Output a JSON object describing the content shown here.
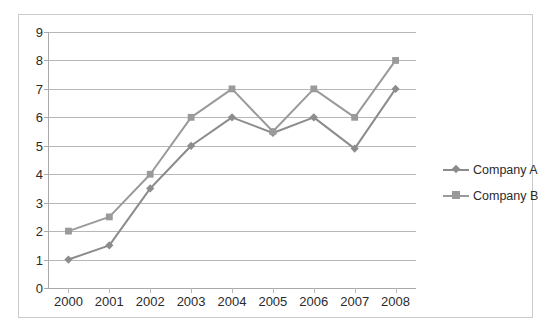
{
  "chart_data": {
    "type": "line",
    "title": "",
    "subtitle": "",
    "xlabel": "",
    "ylabel": "",
    "categories": [
      "2000",
      "2001",
      "2002",
      "2003",
      "2004",
      "2005",
      "2006",
      "2007",
      "2008"
    ],
    "series": [
      {
        "name": "Company A",
        "marker": "diamond",
        "color": "#8c8c8c",
        "values": [
          1,
          1.5,
          3.5,
          5,
          6,
          5.45,
          6,
          4.9,
          7
        ]
      },
      {
        "name": "Company B",
        "marker": "square",
        "color": "#9a9a9a",
        "values": [
          2,
          2.5,
          4,
          6,
          7,
          5.5,
          7,
          6,
          8
        ]
      }
    ],
    "ylim": [
      0,
      9
    ],
    "ytick_step": 1,
    "yticks": [
      "9",
      "8",
      "7",
      "6",
      "5",
      "4",
      "3",
      "2",
      "1",
      "0"
    ],
    "grid": true,
    "grid_axis": "y",
    "legend_position": "right",
    "legend": [
      "Company A",
      "Company B"
    ]
  },
  "legend": {
    "items": [
      {
        "label": "Company A",
        "marker_icon": "diamond-marker-icon",
        "color": "#8c8c8c"
      },
      {
        "label": "Company B",
        "marker_icon": "square-marker-icon",
        "color": "#9a9a9a"
      }
    ]
  },
  "colors": {
    "series_a": "#8c8c8c",
    "series_b": "#9a9a9a",
    "gridline": "#b6b7b8",
    "axis": "#a9aaab",
    "frame_border": "#c9cacb",
    "text": "#2b2b2b",
    "background": "#ffffff"
  }
}
